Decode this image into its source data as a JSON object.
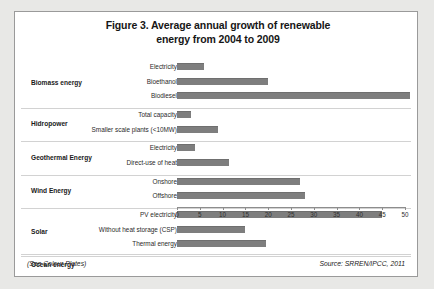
{
  "figure": {
    "title_line1": "Figure 3. Average annual growth of renewable",
    "title_line2": "energy from 2004 to 2009",
    "see_colour_plates": "(See Colour Plates)",
    "source": "Source: SRREN/IPCC, 2011",
    "bar_color": "#7e7e7e",
    "frame_color": "#9a9a9a",
    "background": "#ffffff"
  },
  "chart_data": {
    "type": "bar",
    "orientation": "horizontal",
    "title": "Figure 3. Average annual growth of renewable energy from 2004 to 2009",
    "xlabel": "",
    "ylabel": "",
    "xlim": [
      0,
      50
    ],
    "xticks": [
      0,
      5,
      10,
      15,
      20,
      25,
      30,
      35,
      40,
      45,
      50
    ],
    "tick_labels": [
      "0",
      "5",
      "10",
      "15",
      "20",
      "25",
      "30",
      "35",
      "40",
      "45",
      "50"
    ],
    "grid": false,
    "legend": "none",
    "groups": [
      {
        "name": "Biomass energy",
        "categories": [
          "Electricity",
          "Bioethanol",
          "Biodiesel"
        ],
        "values": [
          6,
          20,
          51
        ]
      },
      {
        "name": "Hidropower",
        "categories": [
          "Total capacity",
          "Smaller scale plants (<10MW)"
        ],
        "values": [
          3,
          9
        ]
      },
      {
        "name": "Geothermal Energy",
        "categories": [
          "Electricity",
          "Direct-use of heat"
        ],
        "values": [
          4,
          11.5
        ]
      },
      {
        "name": "Wind Energy",
        "categories": [
          "Onshore",
          "Offshore"
        ],
        "values": [
          27,
          28
        ]
      },
      {
        "name": "Solar",
        "categories": [
          "PV electricity",
          "Without heat storage (CSP)",
          "Thermal energy"
        ],
        "values": [
          45,
          15,
          19.5
        ]
      },
      {
        "name": "Ocean energy",
        "categories": [],
        "values": []
      }
    ]
  }
}
